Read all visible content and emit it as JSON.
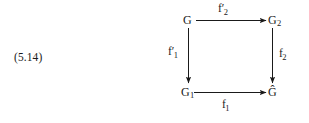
{
  "equation": {
    "tag": "(5.14)"
  },
  "diagram": {
    "kind": "commutative-square",
    "vertices": [
      {
        "id": "top-left",
        "base": "G",
        "subscript": "",
        "accent": "none"
      },
      {
        "id": "top-right",
        "base": "G",
        "subscript": "2",
        "accent": "none"
      },
      {
        "id": "bottom-left",
        "base": "G",
        "subscript": "1",
        "accent": "none"
      },
      {
        "id": "bottom-right",
        "base": "Ĝ",
        "subscript": "",
        "accent": "circumflex"
      }
    ],
    "morphisms": [
      {
        "id": "top",
        "base": "f",
        "prime": "′",
        "subscript": "2",
        "from": "top-left",
        "to": "top-right",
        "direction": "right"
      },
      {
        "id": "left",
        "base": "f",
        "prime": "′",
        "subscript": "1",
        "from": "top-left",
        "to": "bottom-left",
        "direction": "down"
      },
      {
        "id": "right",
        "base": "f",
        "prime": "",
        "subscript": "2",
        "from": "top-right",
        "to": "bottom-right",
        "direction": "down"
      },
      {
        "id": "bottom",
        "base": "f",
        "prime": "",
        "subscript": "1",
        "from": "bottom-left",
        "to": "bottom-right",
        "direction": "right"
      }
    ],
    "stroke_color": "#1a1a1a"
  },
  "page": {
    "background": "#ffffff",
    "text_color": "#1a1a1a"
  }
}
